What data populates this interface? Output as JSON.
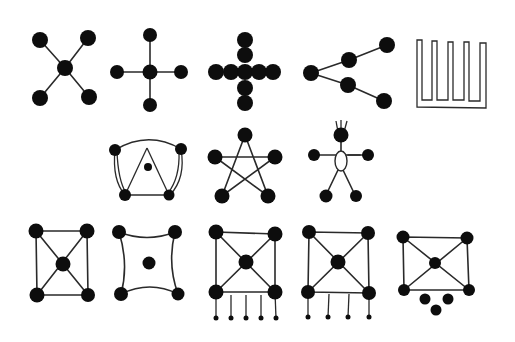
{
  "diagram": {
    "background": "#ffffff",
    "ink": "#0d0d0d",
    "rows": [
      {
        "row": 1,
        "figures": [
          {
            "id": "x-star",
            "label": "Five dots: center with four diagonal spokes"
          },
          {
            "id": "plus-star",
            "label": "Five dots: center with four orthogonal spokes"
          },
          {
            "id": "bead-cross",
            "label": "Cross of touching beads"
          },
          {
            "id": "branching-tree",
            "label": "Root dot branching into two chains of two dots"
          },
          {
            "id": "comb-outline",
            "label": "Closed outline shaped like a comb with five teeth"
          }
        ]
      },
      {
        "row": 2,
        "figures": [
          {
            "id": "arch-triangle",
            "label": "Four dots joined by arcs with inner triangle and center dot"
          },
          {
            "id": "pentagram",
            "label": "Five dots joined as a five-pointed star"
          },
          {
            "id": "stick-figure",
            "label": "Stick figure with dot head, dot hands and feet, oval body"
          }
        ]
      },
      {
        "row": 3,
        "figures": [
          {
            "id": "square-x",
            "label": "Square of four dots with center dot and diagonals"
          },
          {
            "id": "curved-square",
            "label": "Four dots joined by concave curves with isolated center dot"
          },
          {
            "id": "square-x-five-legs",
            "label": "Square with diagonals and five legs ending in small dots"
          },
          {
            "id": "square-x-four-legs",
            "label": "Square with diagonals and four legs ending in small dots"
          },
          {
            "id": "square-x-three-dots",
            "label": "Square with diagonals and three loose dots beneath"
          }
        ]
      }
    ]
  }
}
